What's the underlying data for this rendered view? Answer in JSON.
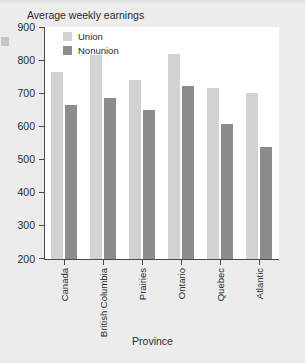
{
  "chart_data": {
    "type": "bar",
    "title": "Average weekly earnings",
    "xlabel": "Province",
    "ylabel": "",
    "categories": [
      "Canada",
      "British Columbia",
      "Prairies",
      "Ontario",
      "Quebec",
      "Atlantic"
    ],
    "series": [
      {
        "name": "Union",
        "color": "#d2d2d2",
        "values": [
          765,
          815,
          740,
          818,
          715,
          700
        ]
      },
      {
        "name": "Nonunion",
        "color": "#8c8c8c",
        "values": [
          665,
          685,
          650,
          723,
          608,
          537
        ]
      }
    ],
    "ylim": [
      200,
      900
    ],
    "ytick_labels": [
      "900",
      "800",
      "700",
      "600",
      "500",
      "400",
      "300",
      "200"
    ],
    "ytick_values": [
      900,
      800,
      700,
      600,
      500,
      400,
      300,
      200
    ],
    "grid": false,
    "legend_position": "top-left-inside"
  },
  "page": {
    "background_color": "#ececec",
    "plot_background_color": "#ffffff",
    "axis_color": "#4a4a4a"
  }
}
